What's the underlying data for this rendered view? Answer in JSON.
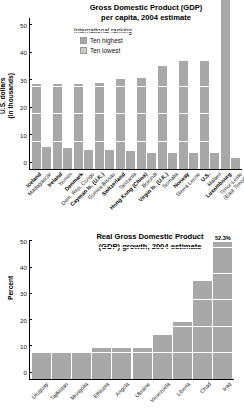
{
  "chart_data": [
    {
      "type": "bar",
      "id": "gdp-per-capita",
      "title": "Gross Domestic Product (GDP)\nper capita, 2004 estimate",
      "title_line1": "Gross Domestic Product (GDP)",
      "title_line2": "per capita, 2004 estimate",
      "legend_title": "International ranking",
      "legend": [
        {
          "label": "Ten highest",
          "color": "#a8a8a8"
        },
        {
          "label": "Ten lowest",
          "color": "#c9c9c9"
        }
      ],
      "ylabel": "U.S. dollars",
      "ylabel_line2": "(in thousands)",
      "xlabel": "",
      "ylim": [
        0,
        55
      ],
      "yticks": [
        0,
        10,
        20,
        30,
        40,
        50
      ],
      "ytick_labels": [
        "0",
        "10",
        "20",
        "30",
        "40",
        "50"
      ],
      "grid": true,
      "categories": [
        "Iceland",
        "Madagascar",
        "Ireland",
        "Yemen",
        "Denmark",
        "Dem. Rep. Congo",
        "Cayman Is. (U.K.)",
        "Guinea-Bissau",
        "Switzerland",
        "Tanzania",
        "Hong Kong (China)",
        "Burundi",
        "Virgin Is. (U.K.)",
        "Somalia",
        "Norway",
        "Sierra Leone",
        "U.S.",
        "Malawi",
        "Luxembourg",
        "Timor-Leste (East Timor)"
      ],
      "category_lines": [
        [
          "Iceland"
        ],
        [
          "Madagascar"
        ],
        [
          "Ireland"
        ],
        [
          "Yemen"
        ],
        [
          "Denmark"
        ],
        [
          "Dem. Rep. Congo"
        ],
        [
          "Cayman Is. (U.K.)"
        ],
        [
          "Guinea-Bissau"
        ],
        [
          "Switzerland"
        ],
        [
          "Tanzania"
        ],
        [
          "Hong Kong (China)"
        ],
        [
          "Burundi"
        ],
        [
          "Virgin Is. (U.K.)"
        ],
        [
          "Somalia"
        ],
        [
          "Norway"
        ],
        [
          "Sierra Leone"
        ],
        [
          "U.S."
        ],
        [
          "Malawi"
        ],
        [
          "Luxembourg"
        ],
        [
          "Timor-Leste",
          "(East Timor)"
        ]
      ],
      "ranking": [
        "highest",
        "lowest",
        "highest",
        "lowest",
        "highest",
        "lowest",
        "highest",
        "lowest",
        "highest",
        "lowest",
        "highest",
        "lowest",
        "highest",
        "lowest",
        "highest",
        "lowest",
        "highest",
        "lowest",
        "highest",
        "lowest"
      ],
      "values": [
        31.0,
        8.0,
        31.0,
        7.6,
        31.1,
        6.8,
        31.5,
        6.8,
        32.7,
        6.7,
        33.2,
        6.0,
        37.6,
        5.8,
        39.3,
        5.9,
        39.3,
        6.0,
        55.0,
        4.1
      ],
      "overflow_index": 18,
      "notes": "Bar 19 (Luxembourg) extends above the top of the plot area."
    },
    {
      "type": "bar",
      "id": "gdp-growth",
      "title": "Real Gross Domestic Product\n(GDP) growth, 2004 estimate",
      "title_line1": "Real Gross Domestic Product",
      "title_line2": "(GDP) growth, 2004 estimate",
      "ylabel": "Percent",
      "xlabel": "",
      "ylim": [
        0,
        53
      ],
      "yticks": [
        0,
        10,
        20,
        30,
        40,
        50
      ],
      "ytick_labels": [
        "0",
        "10",
        "20",
        "30",
        "40",
        "50"
      ],
      "grid": true,
      "categories": [
        "Uruguay",
        "Tajikistan",
        "Mongolia",
        "Ethiopia",
        "Angola",
        "Ukraine",
        "Venezuela",
        "Liberia",
        "Chad",
        "Iraq"
      ],
      "values": [
        10.0,
        10.4,
        10.3,
        11.8,
        11.7,
        12.0,
        16.8,
        21.8,
        37.5,
        52.3
      ],
      "data_labels": [
        "",
        "",
        "",
        "",
        "",
        "",
        "",
        "",
        "",
        "52.3%"
      ]
    }
  ]
}
